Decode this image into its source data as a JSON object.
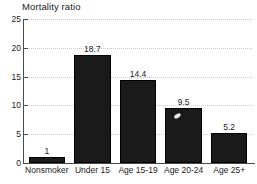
{
  "chart_data": {
    "type": "bar",
    "title": "Mortality ratio",
    "xlabel": "",
    "ylabel": "",
    "ylim": [
      0,
      25
    ],
    "yticks": [
      0,
      5,
      10,
      15,
      20,
      25
    ],
    "ytick_labels": [
      "0",
      "5",
      "10",
      "15",
      "20",
      "25"
    ],
    "grid": true,
    "legend": "none",
    "categories": [
      "Nonsmoker",
      "Under 15",
      "Age 15-19",
      "Age 20-24",
      "Age 25+"
    ],
    "values": [
      1,
      18.7,
      14.4,
      9.5,
      5.2
    ],
    "data_labels": [
      "1",
      "18.7",
      "14.4",
      "9.5",
      "5.2"
    ],
    "bar_color": "#1a1a1a",
    "grid_color": "#c9c9c9",
    "axis_color": "#4a4a4a",
    "background": "#ffffff"
  }
}
